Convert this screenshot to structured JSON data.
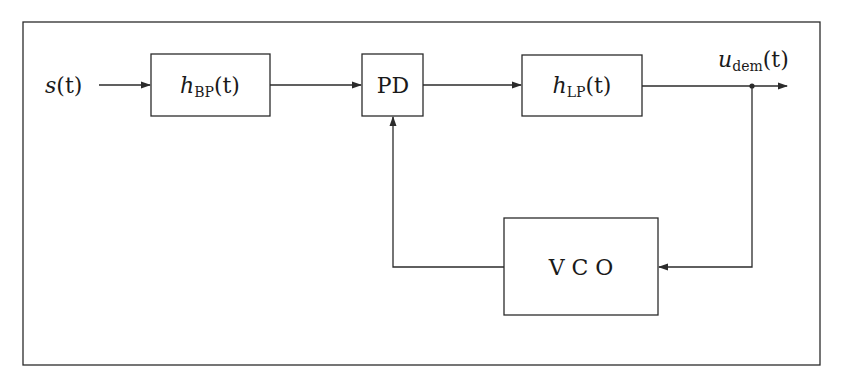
{
  "diagram": {
    "type": "block-diagram",
    "input_signal": {
      "main": "s",
      "arg": "(t)"
    },
    "output_signal": {
      "main": "u",
      "sub": "dem",
      "arg": "(t)"
    },
    "blocks": [
      {
        "id": "bp",
        "main": "h",
        "sub": "BP",
        "arg": "(t)"
      },
      {
        "id": "pd",
        "label": "PD"
      },
      {
        "id": "lp",
        "main": "h",
        "sub": "LP",
        "arg": "(t)"
      },
      {
        "id": "vco",
        "label": "V C O"
      }
    ],
    "connections": [
      {
        "from": "input",
        "to": "bp"
      },
      {
        "from": "bp",
        "to": "pd"
      },
      {
        "from": "pd",
        "to": "lp"
      },
      {
        "from": "lp",
        "to": "output"
      },
      {
        "from": "lp-output-junction",
        "to": "vco"
      },
      {
        "from": "vco",
        "to": "pd"
      }
    ],
    "colors": {
      "line": "#2b2b2b",
      "background": "#ffffff"
    }
  }
}
